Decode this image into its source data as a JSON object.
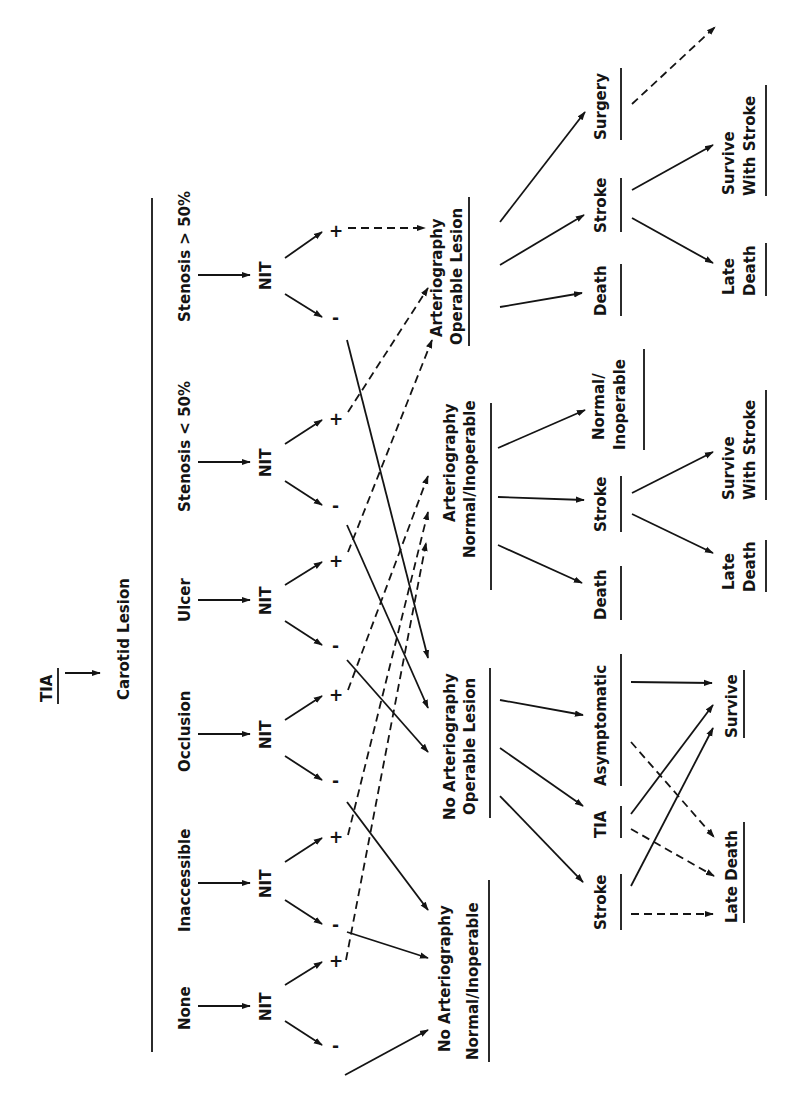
{
  "diagram": {
    "root": "TIA",
    "level1": "Carotid Lesion",
    "categories": [
      {
        "label": "Stenosis > 50%",
        "test": "NIT",
        "pos": "+",
        "neg": "-"
      },
      {
        "label": "Stenosis < 50%",
        "test": "NIT",
        "pos": "+",
        "neg": "-"
      },
      {
        "label": "Ulcer",
        "test": "NIT",
        "pos": "+",
        "neg": "-"
      },
      {
        "label": "Occlusion",
        "test": "NIT",
        "pos": "+",
        "neg": "-"
      },
      {
        "label": "Inaccessible",
        "test": "NIT",
        "pos": "+",
        "neg": "-"
      },
      {
        "label": "None",
        "test": "NIT",
        "pos": "+",
        "neg": "-"
      }
    ],
    "decision_nodes": {
      "art_operable": {
        "line1": "Arteriography",
        "line2": "Operable Lesion"
      },
      "art_normal": {
        "line1": "Arteriography",
        "line2": "Normal/Inoperable"
      },
      "noart_operable": {
        "line1": "No Arteriography",
        "line2": "Operable Lesion"
      },
      "noart_normal": {
        "line1": "No Arteriography",
        "line2": "Normal/Inoperable"
      }
    },
    "outcomes": {
      "art_operable": [
        "Death",
        "Stroke",
        "Surgery"
      ],
      "art_operable_stroke": [
        {
          "line1": "Late",
          "line2": "Death"
        },
        {
          "line1": "Survive",
          "line2": "With Stroke"
        }
      ],
      "art_normal": [
        "Death",
        "Stroke",
        {
          "line1": "Normal/",
          "line2": "Inoperable"
        }
      ],
      "art_normal_stroke": [
        {
          "line1": "Late",
          "line2": "Death"
        },
        {
          "line1": "Survive",
          "line2": "With Stroke"
        }
      ],
      "noart_operable": [
        "Stroke",
        "TIA",
        "Asymptomatic"
      ],
      "noart_final": [
        "Late Death",
        "Survive"
      ]
    },
    "legend": {
      "solid_arrow": "negative result / outcome path",
      "dashed_arrow": "positive result path"
    }
  }
}
